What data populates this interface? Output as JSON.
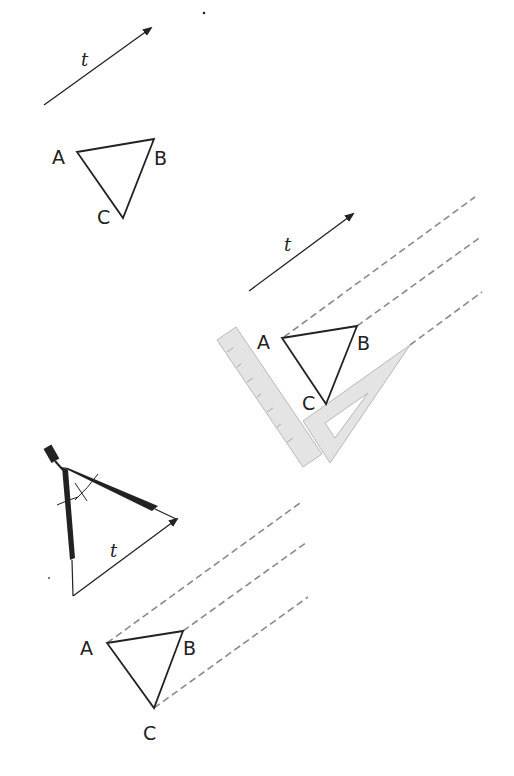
{
  "figure": {
    "step1": {
      "vector_label": "t",
      "vertices": {
        "a": "A",
        "b": "B",
        "c": "C"
      }
    },
    "step2": {
      "vector_label": "t",
      "vertices": {
        "a": "A",
        "b": "B",
        "c": "C"
      },
      "tools": [
        "ruler",
        "set-square"
      ]
    },
    "step3": {
      "vector_label": "t",
      "vertices": {
        "a": "A",
        "b": "B",
        "c": "C"
      },
      "tools": [
        "compass"
      ]
    },
    "colors": {
      "ink": "#222222",
      "dash": "#8a8a8a",
      "tool_fill": "#e4e4e4",
      "tool_stroke": "#b8b8b8"
    }
  }
}
